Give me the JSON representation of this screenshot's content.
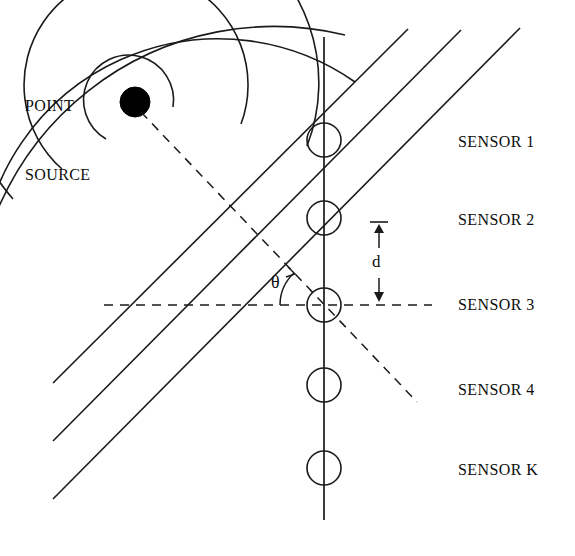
{
  "figure": {
    "background_color": "#ffffff",
    "line_color": "#1a1a1a",
    "source_fill": "#000000",
    "width": 575,
    "height": 556
  },
  "labels": {
    "point_source_line1": "POINT",
    "point_source_line2": "SOURCE",
    "spacing_symbol": "d",
    "angle_symbol": "θ"
  },
  "sensors": [
    {
      "label": "SENSOR 1",
      "cx": 324,
      "cy": 140,
      "r": 17,
      "label_x": 458,
      "label_y": 134
    },
    {
      "label": "SENSOR 2",
      "cx": 324,
      "cy": 218,
      "r": 17,
      "label_x": 458,
      "label_y": 212
    },
    {
      "label": "SENSOR 3",
      "cx": 324,
      "cy": 305,
      "r": 17,
      "label_x": 458,
      "label_y": 296
    },
    {
      "label": "SENSOR 4",
      "cx": 324,
      "cy": 385,
      "r": 17,
      "label_x": 458,
      "label_y": 382
    },
    {
      "label": "SENSOR K",
      "cx": 324,
      "cy": 468,
      "r": 17,
      "label_x": 458,
      "label_y": 461
    }
  ],
  "geometry": {
    "array_axis": {
      "x": 324,
      "y_top": 37,
      "y_bottom": 520
    },
    "point_source": {
      "cx": 135,
      "cy": 102,
      "r": 15
    },
    "wavefront_arcs": [
      {
        "radius": 45
      },
      {
        "radius": 112
      },
      {
        "radius": 175
      },
      {
        "radius": 238
      },
      {
        "radius": 300
      }
    ],
    "plane_wavefronts": [
      {
        "x1": 53,
        "y1": 383,
        "x2": 408,
        "y2": 29
      },
      {
        "x1": 53,
        "y1": 441,
        "x2": 461,
        "y2": 30
      },
      {
        "x1": 53,
        "y1": 499,
        "x2": 520,
        "y2": 28
      }
    ],
    "propagation_ray": {
      "x1": 141,
      "y1": 112,
      "x2": 417,
      "y2": 402
    },
    "reference_axis_dashed": {
      "x1": 104,
      "y1": 305,
      "x2": 432,
      "y2": 305
    },
    "spacing_dimension": {
      "x": 379,
      "y_top": 222,
      "y_bottom": 303,
      "cap_half_width": 9
    },
    "angle_arc": {
      "cx": 324,
      "cy": 305,
      "radius": 44,
      "start_deg": 180,
      "end_deg": 226
    },
    "theta_label_pos": {
      "x": 275,
      "y": 273
    },
    "d_label_pos": {
      "x": 371,
      "y": 253
    },
    "point_source_label_pos": {
      "x": 25,
      "y": 48
    }
  }
}
